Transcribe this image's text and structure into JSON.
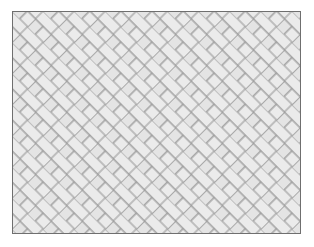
{
  "image": {
    "title": "Herringbone brick paving pattern",
    "subject": "herringbone-tiling",
    "width": 314,
    "height": 247,
    "background_color": "#ffffff"
  },
  "panel": {
    "name": "pattern-panel",
    "x": 12,
    "y": 11,
    "width": 289,
    "height": 223,
    "fill_color": "#e9e9e9",
    "border_color": "#6f6f6f",
    "border_width": 1
  },
  "pattern": {
    "type": "herringbone",
    "orientation_degrees": 45,
    "brick_length": 22,
    "brick_width": 11,
    "repeat_period": 22,
    "brick_fill_color": "#ebebeb",
    "brick_fill_alt_color": "#e4e4e4",
    "mortar_color": "#9a9a9a",
    "mortar_width": 1.1,
    "columns": 14,
    "rows": 11,
    "description": "Two-brick L-shaped repeat unit, alternating horizontal and vertical bricks rotated 45 degrees"
  }
}
